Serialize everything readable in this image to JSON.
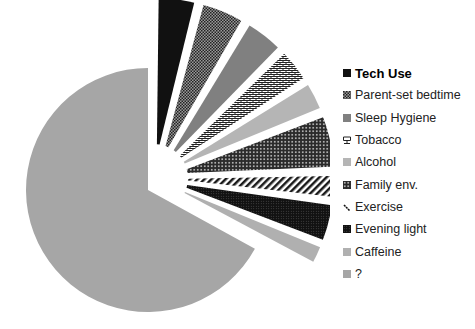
{
  "chart_data": {
    "type": "pie",
    "title": "",
    "exploded": [
      "Tech Use",
      "Parent-set bedtime",
      "Sleep Hygiene",
      "Tobacco",
      "Alcohol",
      "Family env.",
      "Exercise",
      "Evening light",
      "Caffeine"
    ],
    "start_angle_deg": 0,
    "direction": "clockwise",
    "legend_position": "right",
    "categories": [
      "Tech Use",
      "Parent-set bedtime",
      "Sleep Hygiene",
      "Tobacco",
      "Alcohol",
      "Family env.",
      "Exercise",
      "Evening light",
      "Caffeine",
      "?"
    ],
    "values": [
      4,
      4.5,
      4,
      3.5,
      3,
      5.5,
      2.5,
      4,
      2,
      67
    ],
    "fills": [
      {
        "color": "#111111",
        "pattern": "solid"
      },
      {
        "color": "#3a3a3a",
        "pattern": "checker"
      },
      {
        "color": "#808080",
        "pattern": "solid"
      },
      {
        "color": "#555555",
        "pattern": "brick"
      },
      {
        "color": "#b5b5b5",
        "pattern": "solid"
      },
      {
        "color": "#333333",
        "pattern": "dots"
      },
      {
        "color": "#222222",
        "pattern": "diagonal"
      },
      {
        "color": "#1a1a1a",
        "pattern": "dense"
      },
      {
        "color": "#b0b0b0",
        "pattern": "solid"
      },
      {
        "color": "#a6a6a6",
        "pattern": "solid"
      }
    ]
  },
  "legend": {
    "items": [
      {
        "label": "Tech Use",
        "bold": true
      },
      {
        "label": "Parent-set bedtime",
        "bold": false
      },
      {
        "label": "Sleep Hygiene",
        "bold": false
      },
      {
        "label": "Tobacco",
        "bold": false
      },
      {
        "label": "Alcohol",
        "bold": false
      },
      {
        "label": "Family env.",
        "bold": false
      },
      {
        "label": "Exercise",
        "bold": false
      },
      {
        "label": "Evening light",
        "bold": false
      },
      {
        "label": "Caffeine",
        "bold": false
      },
      {
        "label": "?",
        "bold": false
      }
    ]
  }
}
